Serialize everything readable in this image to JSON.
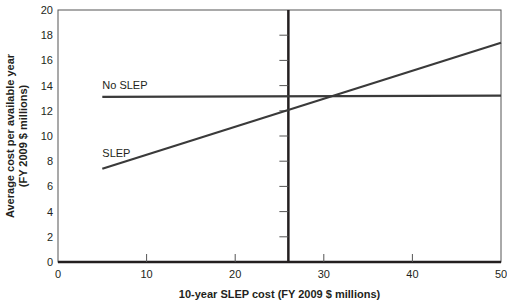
{
  "chart_data": {
    "type": "line",
    "title": "",
    "xlabel": "10-year SLEP cost (FY 2009 $ millions)",
    "ylabel": [
      "Average cost per available year",
      "(FY 2009 $ millions)"
    ],
    "xlim": [
      0,
      50
    ],
    "ylim": [
      0,
      20
    ],
    "x_ticks": [
      0,
      10,
      20,
      30,
      40,
      50
    ],
    "y_ticks": [
      0,
      2,
      4,
      6,
      8,
      10,
      12,
      14,
      16,
      18,
      20
    ],
    "grid": false,
    "series": [
      {
        "name": "No SLEP",
        "x": [
          5,
          50
        ],
        "values": [
          13.1,
          13.2
        ],
        "label_pos": [
          5,
          13.7
        ]
      },
      {
        "name": "SLEP",
        "x": [
          5,
          50
        ],
        "values": [
          7.4,
          17.4
        ],
        "label_pos": [
          5,
          8.3
        ]
      }
    ],
    "reference_line": {
      "orientation": "vertical",
      "x": 26,
      "note": "intersects SLEP at ~12.0; minor y ticks along its left side"
    },
    "legend": "inline labels"
  }
}
